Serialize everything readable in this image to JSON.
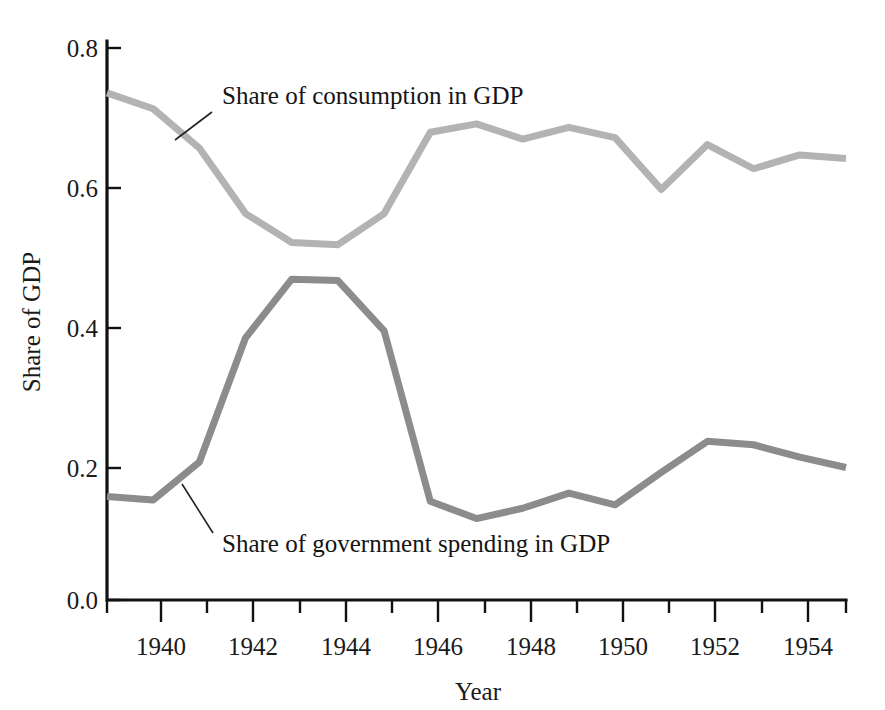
{
  "chart_data": {
    "type": "line",
    "title": "",
    "xlabel": "Year",
    "ylabel": "Share of GDP",
    "xlim": [
      1939,
      1955
    ],
    "ylim": [
      0.0,
      0.8
    ],
    "grid": false,
    "legend_position": "inline-annotations",
    "y_ticks": [
      "0.0",
      "0.2",
      "0.4",
      "0.6",
      "0.8"
    ],
    "y_tick_values": [
      0.0,
      0.2,
      0.4,
      0.6,
      0.8
    ],
    "x_ticks": [
      "1940",
      "1942",
      "1944",
      "1946",
      "1948",
      "1950",
      "1952",
      "1954"
    ],
    "x_tick_values": [
      1940,
      1942,
      1944,
      1946,
      1948,
      1950,
      1952,
      1954
    ],
    "x_minor_tick_values": [
      1939,
      1941,
      1943,
      1945,
      1947,
      1949,
      1951,
      1953,
      1955
    ],
    "x": [
      1939,
      1940,
      1941,
      1942,
      1943,
      1944,
      1945,
      1946,
      1947,
      1948,
      1949,
      1950,
      1951,
      1952,
      1953,
      1954,
      1955
    ],
    "series": [
      {
        "name": "Share of consumption in GDP",
        "color": "#b3b3b3",
        "values": [
          0.735,
          0.712,
          0.655,
          0.56,
          0.518,
          0.515,
          0.56,
          0.678,
          0.69,
          0.668,
          0.685,
          0.67,
          0.595,
          0.66,
          0.625,
          0.645,
          0.64
        ]
      },
      {
        "name": "Share of government spending in GDP",
        "color": "#8c8c8c",
        "values": [
          0.15,
          0.145,
          0.2,
          0.38,
          0.465,
          0.463,
          0.39,
          0.143,
          0.118,
          0.133,
          0.155,
          0.138,
          0.185,
          0.23,
          0.225,
          0.207,
          0.192
        ]
      }
    ],
    "annotations": [
      {
        "label": "Share of consumption in GDP",
        "text_x": 222,
        "text_y": 104,
        "leader_from_x": 212,
        "leader_from_y": 112,
        "leader_to_x": 175,
        "leader_to_y": 140
      },
      {
        "label": "Share of government spending in GDP",
        "text_x": 222,
        "text_y": 552,
        "leader_from_x": 213,
        "leader_from_y": 533,
        "leader_to_x": 182,
        "leader_to_y": 484
      }
    ]
  },
  "axes": {
    "ylabel": "Share of GDP",
    "xlabel": "Year"
  }
}
